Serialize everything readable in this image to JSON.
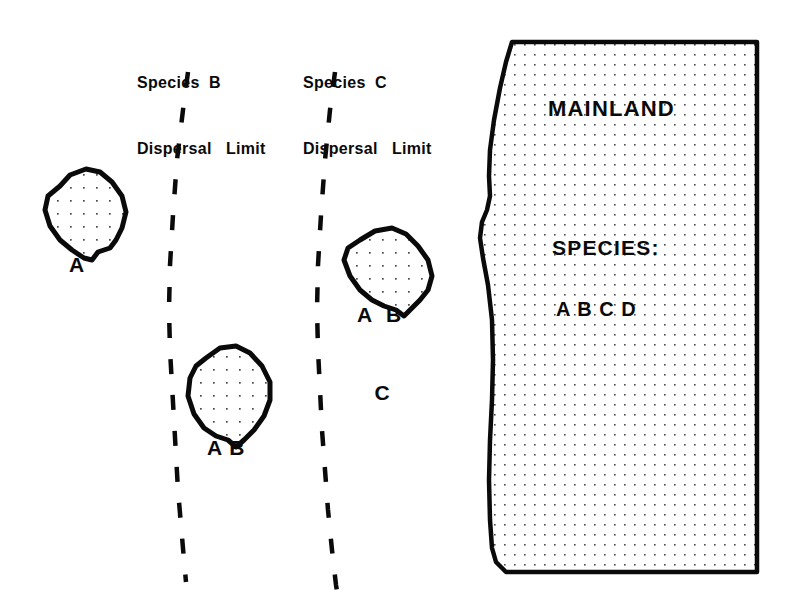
{
  "figure": {
    "type": "biogeography-island-dispersal-diagram",
    "background_color": "#ffffff",
    "ink_color": "#0a0a0a",
    "width": 793,
    "height": 615
  },
  "dispersal_limits": [
    {
      "id": "species-b",
      "line1": "Species  B",
      "line2": "Dispersal   Limit",
      "label_x": 137,
      "label_y": 28,
      "dash_path": "M 188 72 L 183 110 L 177 160 L 173 215 L 170 265 L 169 310 L 170 350 L 172 385 L 174 420 L 176 455 L 178 490 L 181 525 L 184 560 L 186 582"
    },
    {
      "id": "species-c",
      "line1": "Species  C",
      "line2": "Dispersal   Limit",
      "label_x": 303,
      "label_y": 28,
      "dash_path": "M 335 72 L 330 110 L 325 160 L 321 215 L 318 265 L 317 310 L 318 350 L 320 390 L 322 430 L 325 470 L 328 510 L 332 550 L 336 585 L 339 603"
    }
  ],
  "islands": [
    {
      "id": "island-a",
      "labels": [
        "A"
      ],
      "label_x": 69,
      "label_y": 200,
      "outline": "M 60 186 L 70 175 L 86 169 L 100 172 L 112 182 L 122 196 L 126 212 L 122 228 L 116 240 L 110 248 L 98 252 L 92 260 L 84 258 L 72 250 L 60 240 L 50 226 L 45 210 L 48 196 Z"
    },
    {
      "id": "island-ab",
      "labels": [
        "A B"
      ],
      "label_x": 207,
      "label_y": 383,
      "outline": "M 206 358 L 220 348 L 236 346 L 250 353 L 262 366 L 270 382 L 270 400 L 264 416 L 254 430 L 244 440 L 236 447 L 228 440 L 216 436 L 204 428 L 194 414 L 188 396 L 190 378 L 196 366 Z"
    },
    {
      "id": "island-abc",
      "labels": [
        "A  B",
        "C"
      ],
      "label_x": 357,
      "label_y": 250,
      "outline": "M 360 240 L 375 231 L 392 228 L 406 234 L 418 246 L 428 260 L 432 276 L 428 290 L 420 300 L 412 308 L 404 316 L 396 310 L 384 306 L 372 300 L 360 290 L 350 276 L 344 260 L 348 248 Z"
    }
  ],
  "mainland": {
    "id": "mainland",
    "title": "MAINLAND",
    "title_x": 548,
    "title_y": 96,
    "species_heading": "SPECIES:",
    "species_heading_x": 552,
    "species_heading_y": 236,
    "species_list": "A B C D",
    "species_list_x": 556,
    "species_list_y": 298,
    "outline": "M 512 42 L 757 42 L 757 572 L 506 572 L 496 562 L 492 548 L 490 520 L 489 480 L 490 440 L 492 400 L 493 360 L 492 320 L 488 285 L 483 258 L 480 238 L 482 222 L 487 210 L 490 196 L 489 176 L 490 150 L 494 120 L 500 88 L 506 62 Z",
    "fill_pattern": "stipple-dots",
    "stipple_spacing": 10,
    "stipple_color": "#555555"
  }
}
